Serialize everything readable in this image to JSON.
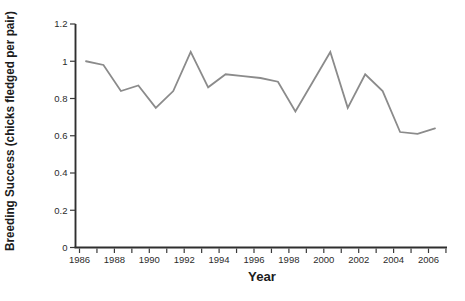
{
  "figure": {
    "background": "#ffffff"
  },
  "chart_data": {
    "type": "line",
    "title": "",
    "xlabel": "Year",
    "ylabel": "Breeding Success (chicks fledged per pair)",
    "x": [
      1986,
      1987,
      1988,
      1989,
      1990,
      1991,
      1992,
      1993,
      1994,
      1995,
      1996,
      1997,
      1998,
      1999,
      2000,
      2001,
      2002,
      2003,
      2004,
      2005,
      2006
    ],
    "values": [
      1.0,
      0.98,
      0.84,
      0.87,
      0.75,
      0.84,
      1.05,
      0.86,
      0.93,
      0.92,
      0.91,
      0.89,
      0.73,
      0.89,
      1.05,
      0.75,
      0.93,
      0.84,
      0.62,
      0.61,
      0.64
    ],
    "ylim": [
      0,
      1.2
    ],
    "xlim": [
      1986,
      2007
    ],
    "y_ticks": [
      "0",
      "0.2",
      "0.4",
      "0.6",
      "0.8",
      "1",
      "1.2"
    ],
    "y_tick_values": [
      0,
      0.2,
      0.4,
      0.6,
      0.8,
      1.0,
      1.2
    ],
    "x_tick_labels": [
      "1986",
      "1988",
      "1990",
      "1992",
      "1994",
      "1996",
      "1998",
      "2000",
      "2002",
      "2004",
      "2006"
    ],
    "x_axis": {
      "start": 1986,
      "end": 2007,
      "minor_tick_every": 1,
      "label_every": 2
    },
    "grid": false,
    "legend": null,
    "line_color": "#8b8b8b",
    "axis_color": "#2f2f2f",
    "tick_color": "#3a3a3a"
  }
}
